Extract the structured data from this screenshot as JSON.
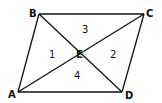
{
  "diagram": {
    "type": "parallelogram-with-diagonals",
    "vertices": [
      {
        "name": "A",
        "x": 18,
        "y": 92,
        "label_x": 8,
        "label_y": 98
      },
      {
        "name": "B",
        "x": 39,
        "y": 14,
        "label_x": 29,
        "label_y": 17
      },
      {
        "name": "C",
        "x": 144,
        "y": 14,
        "label_x": 146,
        "label_y": 17
      },
      {
        "name": "D",
        "x": 122,
        "y": 92,
        "label_x": 125,
        "label_y": 99
      }
    ],
    "intersection": {
      "name": "E",
      "x": 80.5,
      "y": 53,
      "label_x": 76,
      "label_y": 58
    },
    "regions": [
      {
        "label": "1",
        "x": 49,
        "y": 58
      },
      {
        "label": "2",
        "x": 110,
        "y": 58
      },
      {
        "label": "3",
        "x": 82,
        "y": 33
      },
      {
        "label": "4",
        "x": 74,
        "y": 79
      }
    ],
    "edges": [
      [
        "A",
        "B"
      ],
      [
        "B",
        "C"
      ],
      [
        "C",
        "D"
      ],
      [
        "D",
        "A"
      ],
      [
        "A",
        "C"
      ],
      [
        "B",
        "D"
      ]
    ]
  }
}
